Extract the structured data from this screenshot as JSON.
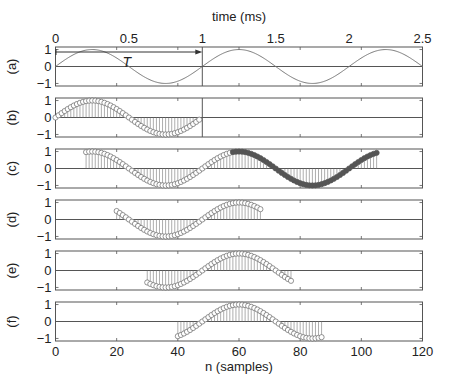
{
  "chart_data": {
    "type": "stem",
    "title": "",
    "signal": "x[n] = sin(2*pi*n/48)",
    "samples_per_period": 48,
    "top_axis": {
      "label": "time (ms)",
      "ticks": [
        0,
        0.5,
        1,
        1.5,
        2,
        2.5
      ],
      "tick_labels": [
        "0",
        "0.5",
        "1",
        "1.5",
        "2",
        "2.5"
      ],
      "range": [
        0,
        2.5
      ]
    },
    "bottom_axis": {
      "label": "n (samples)",
      "ticks": [
        0,
        20,
        40,
        60,
        80,
        100,
        120
      ],
      "tick_labels": [
        "0",
        "20",
        "40",
        "60",
        "80",
        "100",
        "120"
      ],
      "range": [
        0,
        120
      ]
    },
    "y_axis": {
      "ticks": [
        -1,
        0,
        1
      ],
      "tick_labels": [
        "-1",
        "0",
        "1"
      ],
      "range": [
        -1.15,
        1.15
      ]
    },
    "panels": [
      {
        "id": "a",
        "label": "(a)",
        "kind": "continuous",
        "range_ms": [
          0,
          2.5
        ],
        "period_ms": 1,
        "annotation": "T",
        "marker_line_ms": 1
      },
      {
        "id": "b",
        "label": "(b)",
        "kind": "stem",
        "n_start": 0,
        "n_end": 47,
        "filled_start": null,
        "marker_line_n": 48
      },
      {
        "id": "c",
        "label": "(c)",
        "kind": "stem",
        "n_start": 10,
        "n_end": 105,
        "filled_start": 58
      },
      {
        "id": "d",
        "label": "(d)",
        "kind": "stem",
        "n_start": 20,
        "n_end": 67,
        "filled_start": null
      },
      {
        "id": "e",
        "label": "(e)",
        "kind": "stem",
        "n_start": 30,
        "n_end": 77,
        "filled_start": null
      },
      {
        "id": "f",
        "label": "(f)",
        "kind": "stem",
        "n_start": 40,
        "n_end": 87,
        "filled_start": null
      }
    ],
    "colors": {
      "axes": "#555555",
      "stem": "#777777",
      "marker_open": "#666666",
      "marker_filled": "#555555",
      "curve": "#777777"
    }
  },
  "labels": {
    "top_axis_title": "time (ms)",
    "bottom_axis_title": "n (samples)",
    "period_annotation": "T"
  }
}
